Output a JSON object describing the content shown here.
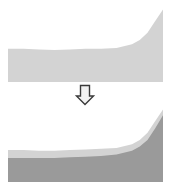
{
  "figure": {
    "title": "",
    "background_color": "#FFFFFF",
    "width": 172,
    "height": 195
  },
  "arrow": {
    "icon": "arrow-down-icon",
    "direction": "down",
    "label": "",
    "fill_color": "#F2F2F2",
    "outline_color": "#3A3A3A"
  },
  "chart_data": [
    {
      "id": "before",
      "type": "area",
      "title": "",
      "subtitle": "",
      "xlabel": "",
      "ylabel": "",
      "xlim": [
        0,
        100
      ],
      "ylim": [
        0,
        100
      ],
      "grid": false,
      "legend": "none",
      "axis_visible": false,
      "tick_labels": [],
      "x": [
        0,
        10,
        20,
        30,
        40,
        50,
        60,
        70,
        80,
        85,
        90,
        95,
        100
      ],
      "series": [
        {
          "name": "Series 1",
          "color": "#D3D3D3",
          "values": [
            46,
            46,
            45,
            44,
            45,
            46,
            46,
            47,
            52,
            58,
            68,
            84,
            100
          ]
        }
      ]
    },
    {
      "id": "after",
      "type": "area",
      "title": "",
      "subtitle": "",
      "xlabel": "",
      "ylabel": "",
      "xlim": [
        0,
        100
      ],
      "ylim": [
        0,
        100
      ],
      "grid": false,
      "legend": "none",
      "axis_visible": false,
      "tick_labels": [],
      "stacked": true,
      "x": [
        0,
        10,
        20,
        30,
        40,
        50,
        60,
        70,
        80,
        85,
        90,
        95,
        100
      ],
      "series": [
        {
          "name": "Series 1",
          "color": "#9A9A9A",
          "values": [
            33,
            33,
            33,
            33,
            34,
            35,
            36,
            38,
            43,
            49,
            58,
            74,
            92
          ]
        },
        {
          "name": "Series 2",
          "color": "#D3D3D3",
          "values": [
            11,
            11,
            10,
            10,
            10,
            10,
            10,
            9,
            9,
            9,
            10,
            10,
            8
          ]
        }
      ]
    }
  ]
}
